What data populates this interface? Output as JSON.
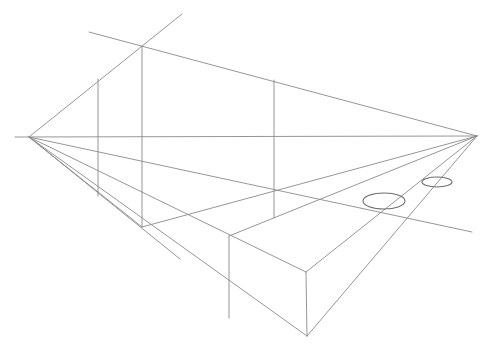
{
  "figure": {
    "title": "Two-point perspective construction sketch",
    "width": 496,
    "height": 358,
    "background": "#ffffff",
    "stroke_color": "#8a8a8a",
    "ellipse_color": "#6e6e6e"
  },
  "vanishing_points": {
    "left": {
      "x": 29,
      "y": 137
    },
    "right": {
      "x": 477,
      "y": 136
    }
  },
  "lines": [
    {
      "name": "horizon-line",
      "x1": 15,
      "y1": 137,
      "x2": 477,
      "y2": 136
    },
    {
      "name": "left-vp-diagonal-up",
      "x1": 29,
      "y1": 137,
      "x2": 182,
      "y2": 14
    },
    {
      "name": "top-line-to-right-vp",
      "x1": 89,
      "y1": 32,
      "x2": 477,
      "y2": 136
    },
    {
      "name": "left-vp-to-box-top-right",
      "x1": 29,
      "y1": 137,
      "x2": 306,
      "y2": 272
    },
    {
      "name": "left-vp-fan-line-1",
      "x1": 29,
      "y1": 137,
      "x2": 472,
      "y2": 232
    },
    {
      "name": "left-vp-fan-line-2",
      "x1": 29,
      "y1": 137,
      "x2": 307,
      "y2": 336
    },
    {
      "name": "left-vp-fan-line-3",
      "x1": 29,
      "y1": 137,
      "x2": 180,
      "y2": 259
    },
    {
      "name": "left-vp-fan-line-4",
      "x1": 29,
      "y1": 137,
      "x2": 142,
      "y2": 227
    },
    {
      "name": "right-vp-to-box-corner",
      "x1": 477,
      "y1": 136,
      "x2": 142,
      "y2": 227
    },
    {
      "name": "right-vp-to-box-top",
      "x1": 477,
      "y1": 136,
      "x2": 229,
      "y2": 236
    },
    {
      "name": "right-vp-to-box-top-front",
      "x1": 477,
      "y1": 136,
      "x2": 306,
      "y2": 272
    },
    {
      "name": "right-vp-to-bottom",
      "x1": 477,
      "y1": 136,
      "x2": 307,
      "y2": 336
    },
    {
      "name": "vertical-1",
      "x1": 98,
      "y1": 79,
      "x2": 98,
      "y2": 196
    },
    {
      "name": "vertical-2",
      "x1": 142,
      "y1": 46,
      "x2": 142,
      "y2": 227
    },
    {
      "name": "vertical-3",
      "x1": 274,
      "y1": 80,
      "x2": 274,
      "y2": 218
    },
    {
      "name": "box-vertical-back",
      "x1": 229,
      "y1": 236,
      "x2": 229,
      "y2": 318
    },
    {
      "name": "box-vertical-front",
      "x1": 306,
      "y1": 272,
      "x2": 307,
      "y2": 336
    }
  ],
  "ellipses": [
    {
      "name": "ellipse-large",
      "cx": 384,
      "cy": 201,
      "rx": 21,
      "ry": 8
    },
    {
      "name": "ellipse-small",
      "cx": 437,
      "cy": 182,
      "rx": 15,
      "ry": 5
    }
  ]
}
